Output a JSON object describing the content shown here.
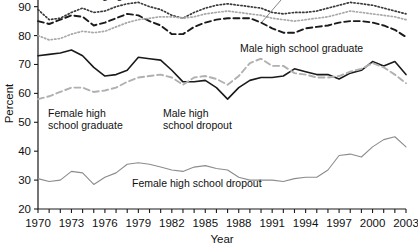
{
  "chart_data": {
    "type": "line",
    "title": "",
    "xlabel": "Year",
    "ylabel": "Percent",
    "xlim": [
      1970,
      2003
    ],
    "ylim": [
      20,
      93
    ],
    "y_ticks": [
      20,
      30,
      40,
      50,
      60,
      70,
      80,
      90
    ],
    "x_tick_labels": [
      "1970",
      "1973",
      "1976",
      "1979",
      "1982",
      "1985",
      "1988",
      "1991",
      "1994",
      "1997",
      "2000",
      "2003"
    ],
    "x_tick_label_years": [
      1970,
      1973,
      1976,
      1979,
      1982,
      1985,
      1988,
      1991,
      1994,
      1997,
      2000,
      2003
    ],
    "x_minor_tick_every": 1,
    "grid": false,
    "legend_position": "inline-annotations",
    "x": [
      1970,
      1971,
      1972,
      1973,
      1974,
      1975,
      1976,
      1977,
      1978,
      1979,
      1980,
      1981,
      1982,
      1983,
      1984,
      1985,
      1986,
      1987,
      1988,
      1989,
      1990,
      1991,
      1992,
      1993,
      1994,
      1995,
      1996,
      1997,
      1998,
      1999,
      2000,
      2001,
      2002,
      2003
    ],
    "series": [
      {
        "name": "Male college graduate",
        "style": "dotted",
        "color": "#3a3a3a",
        "values": [
          89.0,
          85.5,
          86.0,
          88.0,
          89.5,
          88.0,
          88.5,
          90.0,
          91.0,
          91.5,
          90.0,
          89.0,
          87.0,
          86.0,
          88.0,
          89.5,
          90.5,
          91.0,
          90.5,
          90.0,
          89.5,
          88.0,
          87.5,
          88.0,
          88.0,
          88.5,
          89.5,
          90.5,
          91.5,
          91.0,
          90.5,
          89.5,
          88.5,
          87.5
        ]
      },
      {
        "name": "Male high school graduate",
        "style": "dashed",
        "color": "#1a1a1a",
        "values": [
          85.0,
          84.0,
          85.5,
          87.0,
          86.5,
          83.5,
          84.5,
          86.0,
          87.5,
          87.0,
          85.0,
          83.5,
          80.5,
          80.5,
          83.0,
          84.5,
          85.5,
          86.0,
          86.0,
          86.0,
          84.5,
          82.5,
          81.0,
          81.0,
          82.5,
          83.0,
          83.5,
          84.5,
          85.0,
          85.0,
          84.5,
          83.5,
          82.0,
          79.5
        ]
      },
      {
        "name": "Female college graduate",
        "style": "dotted",
        "color": "#a8a8a8",
        "values": [
          80.0,
          78.5,
          79.0,
          80.5,
          81.5,
          81.0,
          81.5,
          83.0,
          84.5,
          85.5,
          86.0,
          86.5,
          86.5,
          86.0,
          86.5,
          87.5,
          88.0,
          88.5,
          88.0,
          87.5,
          87.0,
          86.0,
          85.5,
          85.0,
          85.5,
          86.0,
          86.5,
          87.5,
          88.5,
          88.0,
          87.5,
          87.0,
          86.5,
          85.5
        ]
      },
      {
        "name": "Male high school dropout",
        "style": "solid",
        "color": "#1a1a1a",
        "values": [
          73.0,
          73.5,
          74.0,
          75.0,
          73.0,
          69.0,
          66.0,
          66.5,
          68.0,
          72.5,
          72.0,
          71.5,
          68.0,
          64.0,
          64.0,
          64.5,
          62.0,
          58.0,
          62.0,
          64.5,
          65.5,
          65.5,
          66.0,
          68.5,
          67.5,
          66.5,
          66.5,
          65.0,
          67.0,
          68.0,
          71.0,
          69.5,
          71.0,
          66.5
        ]
      },
      {
        "name": "Female high school graduate",
        "style": "dashed",
        "color": "#b0b0b0",
        "values": [
          58.0,
          59.0,
          60.5,
          62.0,
          62.0,
          60.5,
          61.0,
          62.0,
          64.0,
          65.5,
          66.0,
          66.5,
          65.5,
          63.0,
          65.5,
          66.0,
          65.0,
          63.0,
          66.0,
          70.5,
          72.0,
          69.5,
          69.5,
          67.0,
          66.5,
          65.5,
          65.5,
          66.0,
          67.5,
          68.5,
          70.5,
          69.0,
          66.5,
          63.5
        ]
      },
      {
        "name": "Female high school dropout",
        "style": "solid",
        "color": "#8c8c8c",
        "values": [
          30.5,
          29.5,
          30.0,
          33.0,
          32.5,
          28.5,
          31.0,
          32.5,
          35.5,
          36.0,
          35.5,
          34.5,
          33.5,
          33.0,
          34.5,
          35.0,
          34.0,
          33.5,
          31.0,
          30.0,
          30.0,
          30.0,
          29.5,
          30.5,
          31.0,
          31.0,
          33.5,
          38.5,
          39.0,
          38.0,
          41.5,
          44.0,
          45.0,
          41.5
        ]
      }
    ],
    "annotations": [
      {
        "name": "male-college-graduate-label",
        "text": "Male college graduate",
        "x": 55,
        "y": -1
      },
      {
        "name": "male-high-school-graduate-label",
        "text": "Male high school graduate",
        "x": 240,
        "y": 52
      },
      {
        "name": "female-high-school-graduate-label",
        "text": "Female high school graduate",
        "x": 48,
        "y": 117,
        "lines": [
          "Female high",
          "school graduate"
        ]
      },
      {
        "name": "male-high-school-dropout-label",
        "text": "Male high school dropout",
        "x": 163,
        "y": 117,
        "lines": [
          "Male high",
          "school dropout"
        ]
      },
      {
        "name": "female-high-school-dropout-label",
        "text": "Female high school dropout",
        "x": 132,
        "y": 187
      }
    ],
    "leader_line": {
      "name": "female-college-graduate-leader",
      "from_x": 281,
      "from_y": 0,
      "to_x": 262,
      "to_y": 22
    }
  }
}
